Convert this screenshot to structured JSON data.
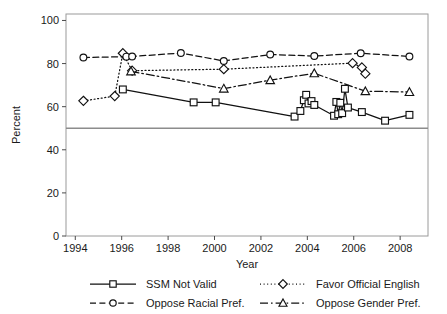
{
  "chart_data": {
    "type": "line",
    "title": "",
    "xlabel": "Year",
    "ylabel": "Percent",
    "xlim": [
      1993.6,
      2009.2
    ],
    "ylim": [
      0,
      103
    ],
    "xticks": [
      1994,
      1996,
      1998,
      2000,
      2002,
      2004,
      2006,
      2008
    ],
    "yticks": [
      0,
      20,
      40,
      60,
      80,
      100
    ],
    "grid": false,
    "legend_position": "bottom",
    "reference_lines": [
      {
        "axis": "y",
        "value": 50,
        "color": "#8c8c8c"
      }
    ],
    "series": [
      {
        "name": "SSM Not Valid",
        "marker": "square",
        "dash": "solid",
        "points": [
          [
            1996.05,
            68.0
          ],
          [
            1999.1,
            62.0
          ],
          [
            2000.05,
            62.0
          ],
          [
            2003.45,
            55.4
          ],
          [
            2003.7,
            58.0
          ],
          [
            2003.85,
            63.0
          ],
          [
            2003.95,
            65.5
          ],
          [
            2004.05,
            61.5
          ],
          [
            2004.18,
            62.6
          ],
          [
            2004.3,
            60.8
          ],
          [
            2005.15,
            55.8
          ],
          [
            2005.25,
            62.2
          ],
          [
            2005.33,
            56.5
          ],
          [
            2005.42,
            61.8
          ],
          [
            2005.5,
            57.0
          ],
          [
            2005.62,
            68.3
          ],
          [
            2005.75,
            59.6
          ],
          [
            2006.35,
            57.5
          ],
          [
            2007.35,
            53.5
          ],
          [
            2008.4,
            56.2
          ]
        ]
      },
      {
        "name": "Favor Official English",
        "marker": "diamond",
        "dash": "dotted",
        "points": [
          [
            1994.35,
            62.7
          ],
          [
            1995.7,
            64.9
          ],
          [
            1996.05,
            84.8
          ],
          [
            1996.45,
            76.7
          ],
          [
            2000.4,
            77.4
          ],
          [
            2005.95,
            80.2
          ],
          [
            2006.35,
            78.2
          ],
          [
            2006.5,
            75.3
          ]
        ]
      },
      {
        "name": "Oppose Racial Pref.",
        "marker": "circle",
        "dash": "dashed",
        "points": [
          [
            1994.35,
            82.8
          ],
          [
            1996.2,
            83.2
          ],
          [
            1996.45,
            83.3
          ],
          [
            1998.55,
            84.9
          ],
          [
            2000.4,
            81.2
          ],
          [
            2002.4,
            84.2
          ],
          [
            2004.3,
            83.5
          ],
          [
            2006.3,
            84.8
          ],
          [
            2008.4,
            83.3
          ]
        ]
      },
      {
        "name": "Oppose Gender Pref.",
        "marker": "triangle",
        "dash": "dashdot",
        "points": [
          [
            1996.4,
            76.4
          ],
          [
            2000.4,
            68.4
          ],
          [
            2002.4,
            72.3
          ],
          [
            2004.3,
            75.5
          ],
          [
            2006.5,
            67.2
          ],
          [
            2008.4,
            66.8
          ]
        ]
      }
    ],
    "legend": [
      {
        "label": "SSM Not Valid",
        "marker": "square",
        "dash": "solid"
      },
      {
        "label": "Favor Official English",
        "marker": "diamond",
        "dash": "dotted"
      },
      {
        "label": "Oppose Racial Pref.",
        "marker": "circle",
        "dash": "dashed"
      },
      {
        "label": "Oppose Gender Pref.",
        "marker": "triangle",
        "dash": "dashdot"
      }
    ],
    "colors": {
      "line": "#111111",
      "marker_fill": "#ffffff",
      "frame": "#9a9a9a",
      "reference_line": "#8c8c8c",
      "background": "#ffffff"
    }
  }
}
